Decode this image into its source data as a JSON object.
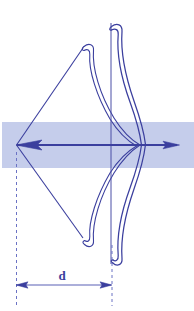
{
  "figure": {
    "kind": "technical-line-diagram",
    "background_color": "#ffffff",
    "line_color": "#3b3f9e",
    "line_color_light": "#6b72c4",
    "band_color": "#c5cdeb",
    "label_color": "#3b3f9e",
    "width": 194,
    "height": 311
  },
  "labels": {
    "distance": "d"
  },
  "band": {
    "name": "arrow-flight-corridor",
    "x": 2,
    "y": 122,
    "width": 192,
    "height": 46,
    "color": "#c5cdeb"
  },
  "arrow": {
    "name": "arrow-on-string",
    "axis_y": 145,
    "nock_x": 16,
    "tip_x": 179,
    "head_back_x": 163,
    "nock_head_x": 40
  },
  "riser": {
    "name": "bow-riser-vertical-line",
    "x": 111,
    "top_y": 23,
    "bottom_y": 264
  },
  "string": {
    "name": "bowstring",
    "nock_x": 16,
    "nock_y": 145,
    "upper_x": 83,
    "upper_y": 48,
    "lower_x": 83,
    "lower_y": 238
  },
  "dimension": {
    "name": "draw-distance-d",
    "label": "d",
    "line_y": 285,
    "left_x": 16,
    "right_x": 112,
    "label_x": 62,
    "label_y": 280,
    "left_guide_top_y": 152,
    "left_guide_bottom_y": 306,
    "right_guide_top_y": 245,
    "right_guide_bottom_y": 306
  },
  "limbs": {
    "upper_tip_x": 112,
    "upper_tip_y": 25,
    "lower_tip_x": 114,
    "lower_tip_y": 262,
    "belly_max_x": 146
  }
}
